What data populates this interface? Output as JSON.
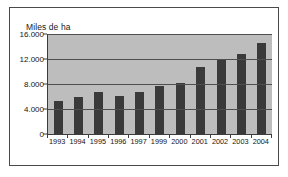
{
  "chart_data": {
    "type": "bar",
    "title": "",
    "ylabel": "Miles de ha",
    "xlabel": "",
    "categories": [
      "1993",
      "1994",
      "1995",
      "1996",
      "1997",
      "1999",
      "2000",
      "2001",
      "2002",
      "2003",
      "2004"
    ],
    "values": [
      5300,
      6000,
      6700,
      6050,
      6700,
      7700,
      8100,
      10700,
      11800,
      12800,
      14500
    ],
    "ylim": [
      0,
      16000
    ],
    "yticks": [
      0,
      4000,
      8000,
      12000,
      16000
    ],
    "ytick_labels": [
      "0",
      "4.000",
      "8.000",
      "12.000",
      "16.000"
    ],
    "grid": true,
    "legend": false,
    "colors": {
      "bar": "#3a3a3a",
      "plot_background": "#bdbdbd",
      "gridline": "#4f4f4f",
      "axis": "#3d3d3d",
      "border": "#4a4a4a",
      "text": "#141414"
    }
  }
}
